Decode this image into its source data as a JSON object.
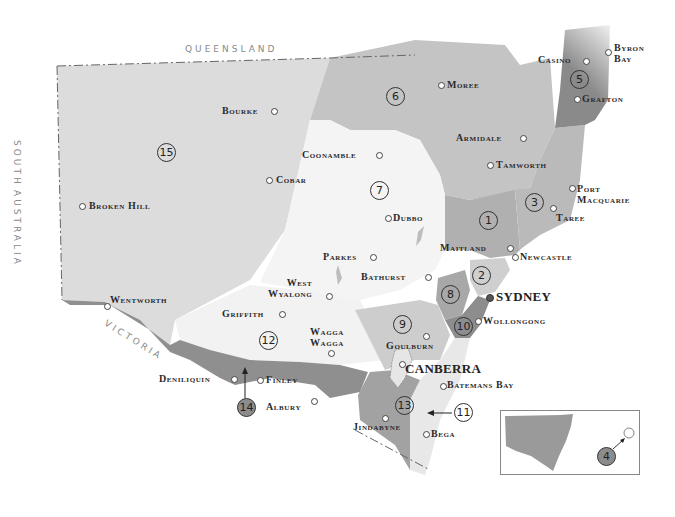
{
  "map": {
    "title": "New South Wales regions",
    "colors": {
      "background": "#ffffff",
      "outback": "#dcdcdc",
      "central": "#f3f3f3",
      "light_region": "#c8c8c8",
      "mid_region": "#b4b4b4",
      "dark_region": "#8f8f8f",
      "border": "#666666"
    },
    "neighbours": {
      "north": "QUEENSLAND",
      "west_1": "SOUTH",
      "west_2": "AUSTRALIA",
      "south": "VICTORIA"
    },
    "regions": [
      {
        "id": "1",
        "label": "1"
      },
      {
        "id": "2",
        "label": "2"
      },
      {
        "id": "3",
        "label": "3"
      },
      {
        "id": "4",
        "label": "4"
      },
      {
        "id": "5",
        "label": "5"
      },
      {
        "id": "6",
        "label": "6"
      },
      {
        "id": "7",
        "label": "7"
      },
      {
        "id": "8",
        "label": "8"
      },
      {
        "id": "9",
        "label": "9"
      },
      {
        "id": "10",
        "label": "10"
      },
      {
        "id": "11",
        "label": "11"
      },
      {
        "id": "12",
        "label": "12"
      },
      {
        "id": "13",
        "label": "13"
      },
      {
        "id": "14",
        "label": "14"
      },
      {
        "id": "15",
        "label": "15"
      }
    ],
    "towns": {
      "bourke": "Bourke",
      "cobar": "Cobar",
      "broken_hill": "Broken Hill",
      "coonamble": "Coonamble",
      "moree": "Moree",
      "casino": "Casino",
      "byron_bay": "Byron\nBay",
      "grafton": "Grafton",
      "armidale": "Armidale",
      "tamworth": "Tamworth",
      "port_macquarie": "Port\nMacquarie",
      "taree": "Taree",
      "dubbo": "Dubbo",
      "maitland": "Maitland",
      "newcastle": "Newcastle",
      "parkes": "Parkes",
      "bathurst": "Bathurst",
      "west_wyalong": "West\nWyalong",
      "sydney": "SYDNEY",
      "wentworth": "Wentworth",
      "griffith": "Griffith",
      "wollongong": "Wollongong",
      "wagga_wagga": "Wagga\nWagga",
      "goulburn": "Goulburn",
      "canberra": "CANBERRA",
      "batemans_bay": "Batemans Bay",
      "deniliquin": "Deniliquin",
      "finley": "Finley",
      "albury": "Albury",
      "jindabyne": "Jindabyne",
      "bega": "Bega"
    },
    "inset": {
      "region_label": "4",
      "description": "Lord Howe Island locator"
    }
  }
}
